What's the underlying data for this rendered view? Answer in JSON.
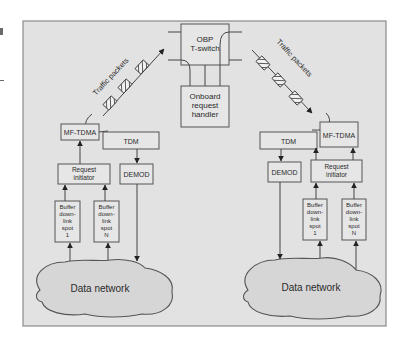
{
  "diagram": {
    "colors": {
      "panel_bg": "#e2e2e2",
      "box_bg": "#e6e6e6",
      "stroke": "#555555",
      "cloud_fill": "#d6d6d6"
    },
    "center": {
      "switch": {
        "line1": "OBP",
        "line2": "T-switch"
      },
      "handler": {
        "line1": "Onboard",
        "line2": "request",
        "line3": "handler"
      }
    },
    "left": {
      "traffic_label": "Traffic packets",
      "mftdma": "MF-TDMA",
      "tdm": "TDM",
      "request": {
        "line1": "Request",
        "line2": "initiator"
      },
      "demod": "DEMOD",
      "buffer1": {
        "l1": "Buffer",
        "l2": "down-",
        "l3": "link",
        "l4": "spot",
        "l5": "1"
      },
      "bufferN": {
        "l1": "Buffer",
        "l2": "down-",
        "l3": "link",
        "l4": "spot",
        "l5": "N"
      },
      "network": "Data network"
    },
    "right": {
      "traffic_label": "Traffic packets",
      "mftdma": "MF-TDMA",
      "tdm": "TDM",
      "request": {
        "line1": "Request",
        "line2": "initiator"
      },
      "demod": "DEMOD",
      "buffer1": {
        "l1": "Buffer",
        "l2": "down-",
        "l3": "link",
        "l4": "spot",
        "l5": "1"
      },
      "bufferN": {
        "l1": "Buffer",
        "l2": "down-",
        "l3": "link",
        "l4": "spot",
        "l5": "N"
      },
      "network": "Data network"
    }
  }
}
